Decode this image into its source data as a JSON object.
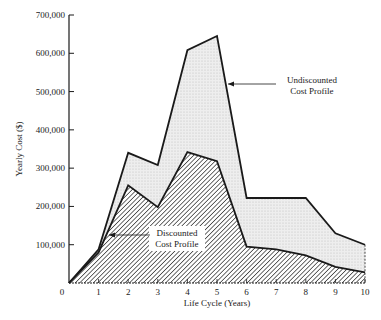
{
  "chart_data": {
    "type": "area",
    "title": "",
    "xlabel": "Life Cycle (Years)",
    "ylabel": "Yearly Cost ($)",
    "x": [
      0,
      1,
      2,
      3,
      4,
      5,
      6,
      7,
      8,
      9,
      10
    ],
    "xlim": [
      0,
      10
    ],
    "ylim": [
      0,
      700000
    ],
    "x_ticks": [
      "0",
      "1",
      "2",
      "3",
      "4",
      "5",
      "6",
      "7",
      "8",
      "9",
      "10"
    ],
    "y_ticks": [
      "100,000",
      "200,000",
      "300,000",
      "400,000",
      "500,000",
      "600,000",
      "700,000"
    ],
    "y_tick_values": [
      100000,
      200000,
      300000,
      400000,
      500000,
      600000,
      700000
    ],
    "grid": false,
    "legend": "inline annotations",
    "series": [
      {
        "name": "Undiscounted Cost Profile",
        "fill": "light stipple",
        "values": [
          0,
          88000,
          340000,
          308000,
          608000,
          645000,
          222000,
          222000,
          222000,
          130000,
          100000
        ]
      },
      {
        "name": "Discounted Cost Profile",
        "fill": "diagonal hatch",
        "values": [
          0,
          80000,
          255000,
          198000,
          342000,
          318000,
          95000,
          88000,
          72000,
          42000,
          28000
        ]
      }
    ],
    "annotations": [
      {
        "text_line1": "Undiscounted",
        "text_line2": "Cost Profile",
        "points_to_year": 5
      },
      {
        "text_line1": "Discounted",
        "text_line2": "Cost Profile",
        "points_to_year": 1.3
      }
    ]
  },
  "labels": {
    "origin": "0",
    "ann_undisc_1": "Undiscounted",
    "ann_undisc_2": "Cost Profile",
    "ann_disc_1": "Discounted",
    "ann_disc_2": "Cost Profile"
  },
  "colors": {
    "line": "#1a1a1a",
    "stipple_bg": "#eeeeee",
    "stipple_dot": "#bdbdbd",
    "hatch": "#3a3a3a"
  }
}
